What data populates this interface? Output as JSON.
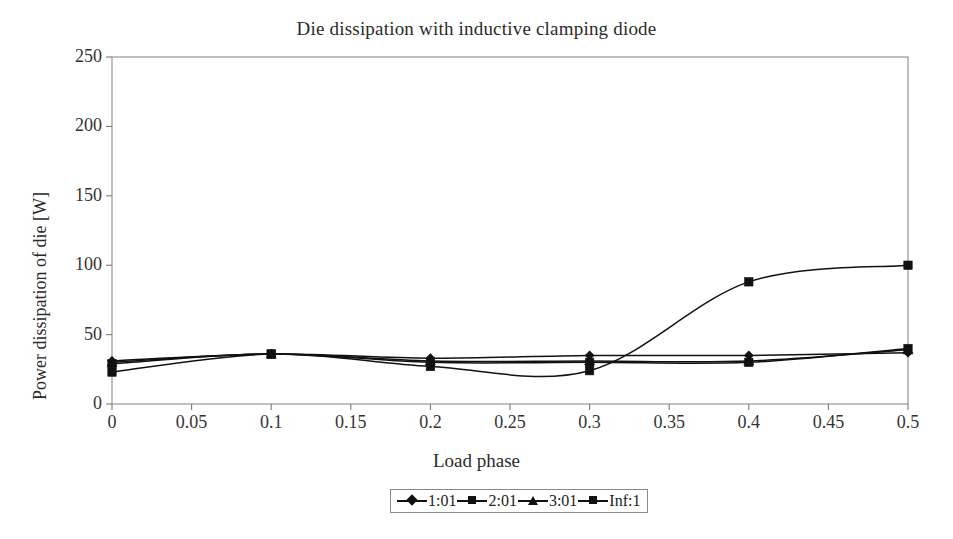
{
  "chart_data": {
    "type": "line",
    "title": "Die dissipation with inductive clamping diode",
    "xlabel": "Load phase",
    "ylabel": "Power dissipation of die [W]",
    "xlim": [
      0,
      0.5
    ],
    "ylim": [
      0,
      250
    ],
    "xticks": [
      "0",
      "0.05",
      "0.1",
      "0.15",
      "0.2",
      "0.25",
      "0.3",
      "0.35",
      "0.4",
      "0.45",
      "0.5"
    ],
    "xtick_values": [
      0,
      0.05,
      0.1,
      0.15,
      0.2,
      0.25,
      0.3,
      0.35,
      0.4,
      0.45,
      0.5
    ],
    "yticks": [
      "0",
      "50",
      "100",
      "150",
      "200",
      "250"
    ],
    "ytick_values": [
      0,
      50,
      100,
      150,
      200,
      250
    ],
    "grid": false,
    "legend_position": "bottom",
    "x": [
      0,
      0.1,
      0.2,
      0.3,
      0.4,
      0.5
    ],
    "series": [
      {
        "name": "1:01",
        "marker": "diamond",
        "color": "#111111",
        "values": [
          31,
          36,
          33,
          35,
          35,
          37
        ]
      },
      {
        "name": "2:01",
        "marker": "square",
        "color": "#111111",
        "values": [
          29,
          36,
          30,
          30,
          30,
          40
        ]
      },
      {
        "name": "3:01",
        "marker": "triangle",
        "color": "#111111",
        "values": [
          30,
          36,
          31,
          31,
          31,
          39
        ]
      },
      {
        "name": "Inf:1",
        "marker": "square",
        "color": "#111111",
        "values": [
          23,
          36,
          27,
          24,
          88,
          100
        ]
      }
    ]
  },
  "legend": {
    "entries": [
      {
        "label": "1:01"
      },
      {
        "label": "2:01"
      },
      {
        "label": "3:01"
      },
      {
        "label": "Inf:1"
      }
    ]
  }
}
